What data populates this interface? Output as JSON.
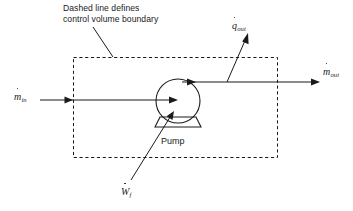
{
  "diagram": {
    "caption": {
      "line1": "Dashed line defines",
      "line2": "control volume boundary"
    },
    "component": {
      "label": "Pump",
      "shape": "circle-with-base"
    },
    "boundary": {
      "style": "dashed",
      "meaning": "control volume boundary"
    },
    "labels": {
      "mass_in": {
        "symbol": "m",
        "dot": true,
        "subscript": "in"
      },
      "mass_out": {
        "symbol": "m",
        "dot": true,
        "subscript": "out"
      },
      "heat_out": {
        "symbol": "q",
        "dot": true,
        "subscript": "out"
      },
      "work_in": {
        "symbol": "W",
        "dot": true,
        "subscript": "f"
      }
    },
    "colors": {
      "stroke": "#1a1a1a",
      "background": "#ffffff"
    }
  }
}
